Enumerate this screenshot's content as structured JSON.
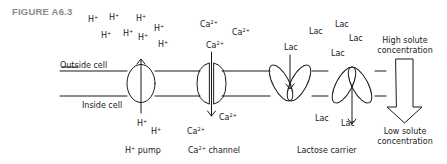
{
  "figure_label": "FIGURE A6.3",
  "regions": {
    "outside": "Outside cell",
    "inside": "Inside cell"
  },
  "ions": {
    "h": "H",
    "h_sup": "+",
    "ca": "Ca",
    "ca_sup": "2+",
    "lac": "Lac"
  },
  "transporters": [
    {
      "name": "H+ pump",
      "label_main": "H",
      "label_sup": "+",
      "label_rest": " pump"
    },
    {
      "name": "Ca2+ channel",
      "label_main": "Ca",
      "label_sup": "2+",
      "label_rest": " channel"
    },
    {
      "name": "Lactose carrier",
      "label": "Lactose carrier"
    }
  ],
  "gradient": {
    "high_line1": "High solute",
    "high_line2": "concentration",
    "low_line1": "Low solute",
    "low_line2": "concentration"
  },
  "colors": {
    "ink": "#1a1a1a",
    "label_gray": "#8a8a8a"
  }
}
